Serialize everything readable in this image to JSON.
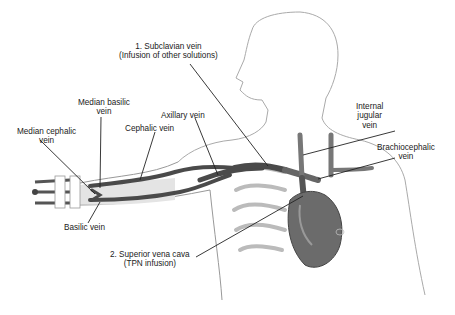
{
  "diagram": {
    "labels": {
      "subclavian": {
        "line1": "1. Subclavian vein",
        "line2": "(Infusion of other solutions)"
      },
      "median_basilic": {
        "line1": "Median basilic",
        "line2": "vein"
      },
      "median_cephalic": {
        "line1": "Median cephalic",
        "line2": "vein"
      },
      "cephalic": {
        "line1": "Cephalic vein"
      },
      "axillary": {
        "line1": "Axillary vein"
      },
      "internal_jugular": {
        "line1": "Internal",
        "line2": "jugular",
        "line3": "vein"
      },
      "brachiocephalic": {
        "line1": "Brachiocephalic",
        "line2": "vein"
      },
      "basilic": {
        "line1": "Basilic vein"
      },
      "svc": {
        "line1": "2. Superior vena cava",
        "line2": "(TPN infusion)"
      }
    },
    "colors": {
      "vein": "#4a4a4a",
      "heart": "#6b6b6b",
      "outline": "#9a9a9a",
      "leader": "#222222",
      "label_text": "#222222"
    }
  }
}
